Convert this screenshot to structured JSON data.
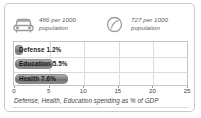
{
  "panel": {
    "border_color": "#c9c9c9"
  },
  "stats": [
    {
      "icon": "car-icon",
      "value": "486",
      "text": "486 per 1000\npopulation"
    },
    {
      "icon": "circle-slash-icon",
      "value": "727",
      "text": "727 per 1000\npopulation"
    }
  ],
  "caption": "Defense, Health, Education spending as % of GDP",
  "chart_data": {
    "type": "bar",
    "orientation": "horizontal",
    "title": "",
    "subtitle": "",
    "xlabel": "Defense, Health, Education spending as % of GDP",
    "ylabel": "",
    "categories": [
      "Defense",
      "Education",
      "Health"
    ],
    "values": [
      1.2,
      5.5,
      7.6
    ],
    "value_labels": [
      "Defense 1.2%",
      "Education 5.5%",
      "Health 7.6%"
    ],
    "xlim": [
      0,
      25
    ],
    "xticks": [
      0,
      5,
      10,
      15,
      20,
      25
    ],
    "xtick_labels": [
      "0",
      "5",
      "10",
      "15",
      "20",
      "25"
    ],
    "grid": true,
    "legend": "none",
    "bar_color": "#8f8f8f"
  }
}
